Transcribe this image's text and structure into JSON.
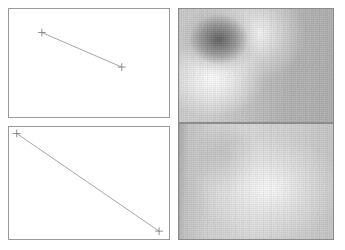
{
  "figure": {
    "title": "",
    "background_color": "#ffffff",
    "width": 345,
    "height": 250,
    "layout": "2x2-panel-grid",
    "panel_border_color": "#9a9a9a"
  },
  "panels": [
    {
      "id": "top-left",
      "name": "top-left-line-plot",
      "type": "line",
      "background_color": "#ffffff",
      "border_color": "#9a9a9a",
      "rect": {
        "x": 8,
        "y": 8,
        "width": 162,
        "height": 110
      },
      "marker": "plus",
      "line_color": "#8d8d8d",
      "axes": {
        "grid": false,
        "ticks": false,
        "xlabel": "",
        "ylabel": ""
      }
    },
    {
      "id": "bottom-left",
      "name": "bottom-left-line-plot",
      "type": "line",
      "background_color": "#ffffff",
      "border_color": "#9a9a9a",
      "rect": {
        "x": 8,
        "y": 126,
        "width": 162,
        "height": 114
      },
      "marker": "plus",
      "line_color": "#8d8d8d",
      "axes": {
        "grid": false,
        "ticks": false,
        "xlabel": "",
        "ylabel": ""
      }
    },
    {
      "id": "top-right",
      "name": "top-right-grayscale-image",
      "type": "heatmap",
      "colormap": "gray",
      "border_color": "#8c8c8c",
      "rect": {
        "x": 178,
        "y": 8,
        "width": 156,
        "height": 115
      },
      "description": "dark blob upper-left with bright arc, mid-gray right side"
    },
    {
      "id": "bottom-right",
      "name": "bottom-right-grayscale-image",
      "type": "heatmap",
      "colormap": "gray",
      "border_color": "#8c8c8c",
      "rect": {
        "x": 178,
        "y": 123,
        "width": 156,
        "height": 117
      },
      "description": "light smooth gray field, darker left edge"
    }
  ],
  "chart_data": [
    {
      "type": "line",
      "panel": "top-left",
      "title": "",
      "xlabel": "",
      "ylabel": "",
      "xlim": [
        0,
        1
      ],
      "ylim": [
        0,
        1
      ],
      "grid": false,
      "legend": null,
      "marker": "+",
      "series": [
        {
          "name": "series-1",
          "color": "#8d8d8d",
          "x": [
            0.205,
            0.705
          ],
          "y": [
            0.782,
            0.462
          ]
        }
      ]
    },
    {
      "type": "line",
      "panel": "bottom-left",
      "title": "",
      "xlabel": "",
      "ylabel": "",
      "xlim": [
        0,
        1
      ],
      "ylim": [
        0,
        1
      ],
      "grid": false,
      "legend": null,
      "marker": "+",
      "series": [
        {
          "name": "series-1",
          "color": "#8d8d8d",
          "x": [
            0.048,
            0.938
          ],
          "y": [
            0.942,
            0.07
          ]
        }
      ]
    },
    {
      "type": "heatmap",
      "panel": "top-right",
      "title": "",
      "xlabel": "",
      "ylabel": "",
      "colormap": "gray",
      "vmin": 0,
      "vmax": 255,
      "grid": false,
      "legend": null,
      "features": [
        {
          "name": "dark-blob",
          "cx": 0.26,
          "cy": 0.27,
          "value": 92
        },
        {
          "name": "bright-arc",
          "cx": 0.22,
          "cy": 0.62,
          "value": 246
        },
        {
          "name": "bright-upper-band",
          "cx": 0.52,
          "cy": 0.22,
          "value": 232
        },
        {
          "name": "mid-gray-right",
          "cx": 0.82,
          "cy": 0.55,
          "value": 176
        }
      ]
    },
    {
      "type": "heatmap",
      "panel": "bottom-right",
      "title": "",
      "xlabel": "",
      "ylabel": "",
      "colormap": "gray",
      "vmin": 0,
      "vmax": 255,
      "grid": false,
      "legend": null,
      "features": [
        {
          "name": "dark-left-edge",
          "cx": 0.02,
          "cy": 0.5,
          "value": 169
        },
        {
          "name": "bright-center",
          "cx": 0.58,
          "cy": 0.56,
          "value": 226
        },
        {
          "name": "soft-dark-patch",
          "cx": 0.3,
          "cy": 0.3,
          "value": 196
        }
      ]
    }
  ]
}
